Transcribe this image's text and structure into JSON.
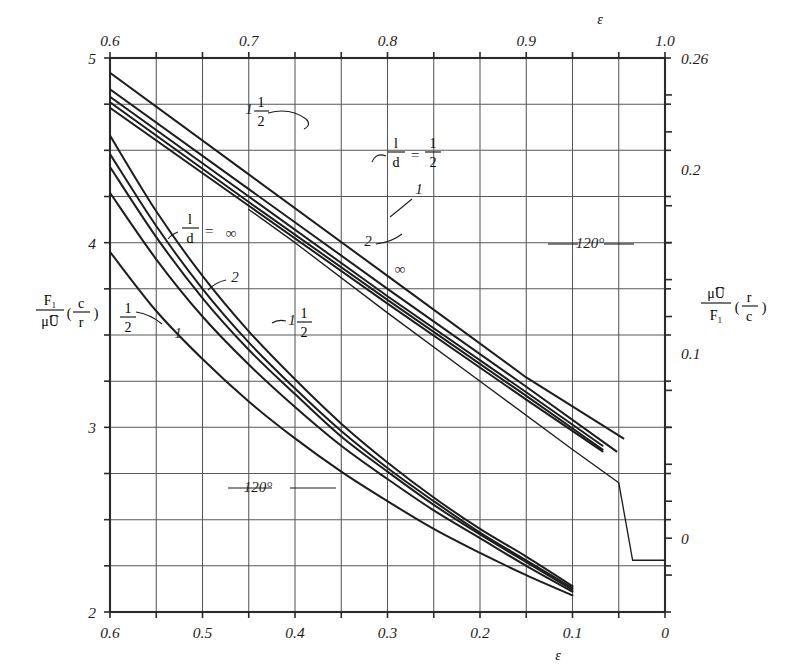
{
  "figure": {
    "background": "#ffffff",
    "ink": "#1d1d1d",
    "grid_color": "#55585c",
    "frame_color": "#2a2a2a"
  },
  "chart_data": {
    "type": "line",
    "title": "",
    "subtitle": "",
    "grid": true,
    "legend_position": "inline-annotations",
    "axes": {
      "bottom": {
        "label": "ε",
        "ticks": [
          "0.6",
          "0.5",
          "0.4",
          "0.3",
          "0.2",
          "0.1",
          "0"
        ],
        "values": [
          0.6,
          0.5,
          0.4,
          0.3,
          0.2,
          0.1,
          0.0
        ],
        "range": [
          0.6,
          0.0
        ],
        "direction": "decreasing",
        "minor_step": 0.05
      },
      "top": {
        "label": "ε",
        "ticks": [
          "0.6",
          "0.7",
          "0.8",
          "0.9",
          "1.0"
        ],
        "values": [
          0.6,
          0.7,
          0.8,
          0.9,
          1.0
        ],
        "range": [
          0.6,
          1.0
        ],
        "direction": "increasing",
        "minor_step": 0.05
      },
      "left": {
        "label_parts": {
          "numerator": "F₁",
          "denominator": "μU̅",
          "factor": "( c / r )"
        },
        "label_text": "F₁ / μU̅ ( c/r )",
        "ticks": [
          "5",
          "4",
          "3",
          "2"
        ],
        "values": [
          5,
          4,
          3,
          2
        ],
        "range": [
          2,
          5
        ],
        "minor_step": 0.25
      },
      "right": {
        "label_parts": {
          "numerator": "μU̅",
          "denominator": "F₁",
          "factor": "( r / c )"
        },
        "label_text": "μU̅ / F₁ ( r/c )",
        "ticks": [
          "0.26",
          "0.2",
          "0.1",
          "0"
        ],
        "values": [
          0.26,
          0.2,
          0.1,
          0.0
        ],
        "range": [
          -0.04,
          0.26
        ],
        "minor_step": 0.02
      }
    },
    "curve_groups": [
      {
        "name": "lower-left-family",
        "description": "F₁/μU̅ (c/r) versus ε on bottom/left scales, 360° bearing family",
        "axis_x": "bottom",
        "axis_y": "left",
        "series": [
          {
            "name": "l/d = ∞",
            "label": "∞",
            "x": [
              0.6,
              0.55,
              0.5,
              0.45,
              0.4,
              0.35,
              0.3,
              0.25,
              0.2,
              0.15,
              0.1
            ],
            "y": [
              4.58,
              4.17,
              3.82,
              3.52,
              3.26,
              3.02,
              2.81,
              2.62,
              2.45,
              2.3,
              2.14
            ]
          },
          {
            "name": "l/d = 2",
            "label": "2",
            "x": [
              0.6,
              0.55,
              0.5,
              0.45,
              0.4,
              0.35,
              0.3,
              0.25,
              0.2,
              0.15,
              0.1
            ],
            "y": [
              4.48,
              4.09,
              3.75,
              3.46,
              3.21,
              2.98,
              2.78,
              2.6,
              2.43,
              2.28,
              2.13
            ]
          },
          {
            "name": "l/d = 1 1/2",
            "label": "1½",
            "x": [
              0.6,
              0.55,
              0.5,
              0.45,
              0.4,
              0.35,
              0.3,
              0.25,
              0.2,
              0.15,
              0.1
            ],
            "y": [
              4.41,
              4.03,
              3.7,
              3.42,
              3.18,
              2.95,
              2.76,
              2.58,
              2.42,
              2.27,
              2.12
            ]
          },
          {
            "name": "l/d = 1",
            "label": "1",
            "x": [
              0.6,
              0.55,
              0.5,
              0.45,
              0.4,
              0.35,
              0.3,
              0.25,
              0.2,
              0.15,
              0.1
            ],
            "y": [
              4.27,
              3.91,
              3.6,
              3.34,
              3.11,
              2.9,
              2.72,
              2.55,
              2.4,
              2.25,
              2.11
            ]
          },
          {
            "name": "l/d = 1/2",
            "label": "½",
            "x": [
              0.6,
              0.55,
              0.5,
              0.45,
              0.4,
              0.35,
              0.3,
              0.25,
              0.2,
              0.15,
              0.1
            ],
            "y": [
              3.95,
              3.63,
              3.37,
              3.14,
              2.94,
              2.76,
              2.6,
              2.45,
              2.32,
              2.2,
              2.09
            ]
          }
        ]
      },
      {
        "name": "upper-right-family",
        "description": "μU̅/F₁ (r/c) versus ε on top/right scales, 360° bearing family",
        "axis_x": "top",
        "axis_y": "right",
        "series": [
          {
            "name": "l/d = 1/2",
            "label": "1/2",
            "x": [
              0.6,
              0.7,
              0.8,
              0.9,
              0.97
            ],
            "y": [
              0.252,
              0.197,
              0.142,
              0.087,
              0.054
            ]
          },
          {
            "name": "l/d = 1",
            "label": "1",
            "x": [
              0.6,
              0.7,
              0.8,
              0.9,
              0.965
            ],
            "y": [
              0.243,
              0.189,
              0.135,
              0.082,
              0.047
            ]
          },
          {
            "name": "l/d = 1 1/2",
            "label": "1½",
            "x": [
              0.6,
              0.7,
              0.8,
              0.9,
              0.955
            ],
            "y": [
              0.239,
              0.185,
              0.131,
              0.079,
              0.05
            ]
          },
          {
            "name": "l/d = 2",
            "label": "2",
            "x": [
              0.6,
              0.7,
              0.8,
              0.9,
              0.955
            ],
            "y": [
              0.236,
              0.182,
              0.129,
              0.077,
              0.048
            ]
          },
          {
            "name": "l/d = ∞",
            "label": "∞",
            "x": [
              0.6,
              0.7,
              0.8,
              0.9,
              0.955
            ],
            "y": [
              0.233,
              0.18,
              0.127,
              0.075,
              0.047
            ]
          }
        ]
      },
      {
        "name": "diagonal-120-line",
        "description": "120° partial bearing reference line with flattened tail near ε = 0",
        "axis_x": "bottom",
        "axis_y": "left",
        "series": [
          {
            "name": "120°",
            "label": "120°",
            "x": [
              0.45,
              0.4,
              0.3,
              0.2,
              0.1,
              0.05,
              0.035,
              0.0
            ],
            "y": [
              4.18,
              4.0,
              3.62,
              3.25,
              2.88,
              2.7,
              2.28,
              2.28
            ]
          }
        ]
      }
    ],
    "annotations": [
      {
        "id": "ann-ld-inf-left",
        "text": "l/d = ∞",
        "kind": "fraction-eq",
        "x": 218,
        "y": 232
      },
      {
        "id": "ann-2-left",
        "text": "2",
        "kind": "plain",
        "x": 232,
        "y": 276
      },
      {
        "id": "ann-1half-left",
        "text": "1 1/2",
        "kind": "mixed",
        "x": 300,
        "y": 320
      },
      {
        "id": "ann-1-left",
        "text": "1",
        "kind": "plain",
        "x": 180,
        "y": 330
      },
      {
        "id": "ann-half-left",
        "text": "1/2",
        "kind": "fraction",
        "x": 128,
        "y": 318
      },
      {
        "id": "ann-120-lower",
        "text": "120°",
        "kind": "plain",
        "x": 256,
        "y": 487
      },
      {
        "id": "ann-1half-top",
        "text": "1 1/2",
        "kind": "mixed",
        "x": 252,
        "y": 110
      },
      {
        "id": "ann-ld-half-top",
        "text": "l/d = 1/2",
        "kind": "fraction-eq",
        "x": 400,
        "y": 156
      },
      {
        "id": "ann-1-top",
        "text": "1",
        "kind": "plain",
        "x": 417,
        "y": 190
      },
      {
        "id": "ann-2-top",
        "text": "2",
        "kind": "plain",
        "x": 371,
        "y": 241
      },
      {
        "id": "ann-inf-top",
        "text": "∞",
        "kind": "plain",
        "x": 399,
        "y": 268
      },
      {
        "id": "ann-120-right",
        "text": "120°",
        "kind": "plain",
        "x": 588,
        "y": 243
      }
    ]
  },
  "labels": {
    "top_axis_symbol": "ε",
    "bottom_axis_symbol": "ε",
    "top_ticks": [
      "0.6",
      "0.7",
      "0.8",
      "0.9",
      "1.0"
    ],
    "bottom_ticks": [
      "0.6",
      "0.5",
      "0.4",
      "0.3",
      "0.2",
      "0.1",
      "0"
    ],
    "left_ticks": [
      "5",
      "4",
      "3",
      "2"
    ],
    "right_ticks": [
      "0.26",
      "0.2",
      "0.1",
      "0"
    ],
    "left_axis_num": "F₁",
    "left_axis_den": "μU̅",
    "left_axis_paren_open": "(",
    "left_axis_fac_num": "c",
    "left_axis_fac_den": "r",
    "left_axis_paren_close": ")",
    "right_axis_num": "μU̅",
    "right_axis_den": "F₁",
    "right_axis_paren_open": "(",
    "right_axis_fac_num": "r",
    "right_axis_fac_den": "c",
    "right_axis_paren_close": ")",
    "ld_num": "l",
    "ld_den": "d",
    "equals": "=",
    "infinity": "∞",
    "one": "1",
    "two": "2",
    "half_num": "1",
    "half_den": "2",
    "deg120": "120°"
  }
}
